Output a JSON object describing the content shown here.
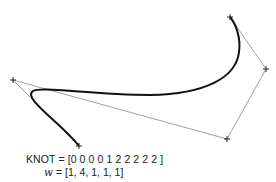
{
  "figure": {
    "knot_text": "KNOT = [0 0 0 0 1 2 2 2 2 2 ]",
    "weight_symbol": "w",
    "weight_text": " = [1, 4, 1, 1, 1]",
    "control_polygon_color": "#888888",
    "curve_color": "#111111",
    "control_points": [
      {
        "x": 79,
        "y": 146
      },
      {
        "x": 13,
        "y": 80
      },
      {
        "x": 227,
        "y": 139
      },
      {
        "x": 266,
        "y": 69
      },
      {
        "x": 230,
        "y": 17
      }
    ]
  }
}
